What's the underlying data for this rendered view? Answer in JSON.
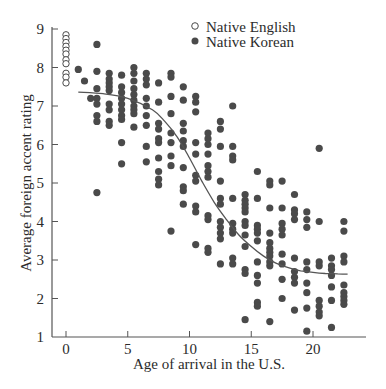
{
  "chart_data": {
    "type": "scatter",
    "title": "",
    "xlabel": "Age of arrival in the U.S.",
    "ylabel": "Average foreign accent rating",
    "xlim": [
      -1,
      24.3
    ],
    "ylim": [
      1,
      9
    ],
    "xticks": [
      0,
      5,
      10,
      15,
      20
    ],
    "yticks": [
      1,
      2,
      3,
      4,
      5,
      6,
      7,
      8,
      9
    ],
    "grid": false,
    "legend": {
      "position": "top-right",
      "entries": [
        {
          "label": "Native English",
          "marker": "open-circle"
        },
        {
          "label": "Native Korean",
          "marker": "filled-circle"
        }
      ]
    },
    "colors": {
      "points": "#4a4a4a",
      "axis": "#555555",
      "curve": "#555555"
    },
    "series": [
      {
        "name": "Native English",
        "marker": "open-circle",
        "points": [
          [
            0,
            8.85
          ],
          [
            0,
            8.75
          ],
          [
            0,
            8.65
          ],
          [
            0,
            8.55
          ],
          [
            0,
            8.45
          ],
          [
            0,
            8.35
          ],
          [
            0,
            8.2
          ],
          [
            0,
            8.1
          ],
          [
            0,
            7.85
          ],
          [
            0,
            7.75
          ],
          [
            0,
            7.6
          ]
        ]
      },
      {
        "name": "Native Korean",
        "marker": "filled-circle",
        "points": [
          [
            1,
            7.95
          ],
          [
            1.5,
            7.65
          ],
          [
            2,
            7.2
          ],
          [
            2.5,
            8.6
          ],
          [
            2.5,
            7.9
          ],
          [
            2.5,
            7.45
          ],
          [
            2.5,
            7.2
          ],
          [
            2.5,
            7.05
          ],
          [
            2.5,
            6.75
          ],
          [
            2.5,
            6.6
          ],
          [
            2.5,
            4.75
          ],
          [
            3.5,
            7.85
          ],
          [
            3.5,
            7.7
          ],
          [
            3.5,
            7.6
          ],
          [
            3.5,
            7.5
          ],
          [
            3.5,
            7.4
          ],
          [
            3.5,
            7.05
          ],
          [
            3.5,
            6.9
          ],
          [
            3.5,
            6.6
          ],
          [
            3.5,
            6.5
          ],
          [
            4.5,
            7.8
          ],
          [
            4.5,
            7.5
          ],
          [
            4.5,
            7.35
          ],
          [
            4.5,
            7.2
          ],
          [
            4.5,
            7.05
          ],
          [
            4.5,
            6.9
          ],
          [
            4.5,
            6.75
          ],
          [
            4.5,
            6.65
          ],
          [
            4.5,
            6.05
          ],
          [
            4.5,
            5.5
          ],
          [
            5.5,
            8.0
          ],
          [
            5.5,
            7.85
          ],
          [
            5.5,
            7.65
          ],
          [
            5.5,
            7.45
          ],
          [
            5.5,
            7.3
          ],
          [
            5.5,
            7.15
          ],
          [
            5.5,
            7.0
          ],
          [
            5.5,
            6.9
          ],
          [
            5.5,
            6.8
          ],
          [
            5.5,
            6.45
          ],
          [
            6.5,
            7.85
          ],
          [
            6.5,
            7.7
          ],
          [
            6.5,
            7.55
          ],
          [
            6.5,
            7.2
          ],
          [
            6.5,
            7.0
          ],
          [
            6.5,
            6.75
          ],
          [
            6.5,
            6.5
          ],
          [
            6.5,
            5.95
          ],
          [
            6.5,
            5.55
          ],
          [
            7.5,
            7.6
          ],
          [
            7.5,
            7.1
          ],
          [
            7.5,
            6.55
          ],
          [
            7.5,
            6.4
          ],
          [
            7.5,
            6.15
          ],
          [
            7.5,
            6.05
          ],
          [
            7.5,
            5.65
          ],
          [
            7.5,
            5.3
          ],
          [
            7.5,
            5.1
          ],
          [
            7.5,
            4.95
          ],
          [
            8.5,
            7.85
          ],
          [
            8.5,
            7.75
          ],
          [
            8.5,
            7.25
          ],
          [
            8.5,
            6.8
          ],
          [
            8.5,
            6.3
          ],
          [
            8.5,
            6.05
          ],
          [
            8.5,
            5.7
          ],
          [
            8.5,
            5.45
          ],
          [
            8.5,
            3.75
          ],
          [
            9.5,
            7.5
          ],
          [
            9.5,
            7.15
          ],
          [
            9.5,
            6.55
          ],
          [
            9.5,
            6.35
          ],
          [
            9.5,
            6.1
          ],
          [
            9.5,
            5.95
          ],
          [
            9.5,
            5.4
          ],
          [
            9.5,
            4.9
          ],
          [
            9.5,
            4.8
          ],
          [
            9.5,
            4.45
          ],
          [
            10.5,
            7.25
          ],
          [
            10.5,
            7.1
          ],
          [
            10.5,
            6.85
          ],
          [
            10.5,
            6.05
          ],
          [
            10.5,
            5.75
          ],
          [
            10.5,
            5.2
          ],
          [
            10.5,
            5.05
          ],
          [
            10.5,
            4.4
          ],
          [
            10.5,
            4.25
          ],
          [
            10.5,
            3.4
          ],
          [
            11.5,
            6.3
          ],
          [
            11.5,
            6.15
          ],
          [
            11.5,
            6.0
          ],
          [
            11.5,
            5.75
          ],
          [
            11.5,
            5.45
          ],
          [
            11.5,
            5.3
          ],
          [
            11.5,
            5.15
          ],
          [
            11.5,
            4.15
          ],
          [
            11.5,
            4.05
          ],
          [
            11.5,
            3.3
          ],
          [
            11.5,
            3.2
          ],
          [
            12.5,
            6.6
          ],
          [
            12.5,
            6.4
          ],
          [
            12.5,
            5.95
          ],
          [
            12.5,
            5.05
          ],
          [
            12.5,
            4.6
          ],
          [
            12.5,
            4.45
          ],
          [
            12.5,
            4.0
          ],
          [
            12.5,
            3.85
          ],
          [
            12.5,
            3.7
          ],
          [
            12.5,
            3.55
          ],
          [
            12.5,
            2.9
          ],
          [
            13.5,
            7.0
          ],
          [
            13.5,
            5.95
          ],
          [
            13.5,
            5.7
          ],
          [
            13.5,
            5.6
          ],
          [
            13.5,
            4.6
          ],
          [
            13.5,
            3.95
          ],
          [
            13.5,
            3.8
          ],
          [
            13.5,
            3.7
          ],
          [
            13.5,
            3.05
          ],
          [
            13.5,
            2.9
          ],
          [
            14.5,
            4.7
          ],
          [
            14.5,
            4.55
          ],
          [
            14.5,
            4.45
          ],
          [
            14.5,
            4.35
          ],
          [
            14.5,
            4.25
          ],
          [
            14.5,
            4.0
          ],
          [
            14.5,
            3.9
          ],
          [
            14.5,
            3.65
          ],
          [
            14.5,
            3.35
          ],
          [
            14.5,
            2.75
          ],
          [
            14.5,
            2.65
          ],
          [
            14.5,
            1.45
          ],
          [
            15.5,
            5.3
          ],
          [
            15.5,
            4.6
          ],
          [
            15.5,
            3.9
          ],
          [
            15.5,
            3.8
          ],
          [
            15.5,
            3.7
          ],
          [
            15.5,
            3.5
          ],
          [
            15.5,
            2.95
          ],
          [
            15.5,
            2.6
          ],
          [
            15.5,
            2.4
          ],
          [
            15.5,
            1.9
          ],
          [
            15.5,
            1.8
          ],
          [
            16.5,
            5.05
          ],
          [
            16.5,
            4.95
          ],
          [
            16.5,
            4.35
          ],
          [
            16.5,
            3.7
          ],
          [
            16.5,
            3.45
          ],
          [
            16.5,
            3.3
          ],
          [
            16.5,
            3.2
          ],
          [
            16.5,
            3.1
          ],
          [
            16.5,
            2.95
          ],
          [
            16.5,
            2.85
          ],
          [
            16.5,
            1.4
          ],
          [
            17.5,
            5.05
          ],
          [
            17.5,
            4.35
          ],
          [
            17.5,
            3.95
          ],
          [
            17.5,
            3.8
          ],
          [
            17.5,
            3.65
          ],
          [
            17.5,
            3.15
          ],
          [
            17.5,
            2.9
          ],
          [
            17.5,
            2.5
          ],
          [
            17.5,
            2.0
          ],
          [
            18.5,
            4.7
          ],
          [
            18.5,
            4.3
          ],
          [
            18.5,
            4.2
          ],
          [
            18.5,
            4.05
          ],
          [
            18.5,
            3.05
          ],
          [
            18.5,
            2.7
          ],
          [
            18.5,
            2.55
          ],
          [
            18.5,
            2.4
          ],
          [
            18.5,
            1.7
          ],
          [
            19.5,
            4.25
          ],
          [
            19.5,
            4.05
          ],
          [
            19.5,
            3.85
          ],
          [
            19.5,
            2.95
          ],
          [
            19.5,
            2.75
          ],
          [
            19.5,
            2.4
          ],
          [
            19.5,
            2.15
          ],
          [
            19.5,
            1.75
          ],
          [
            19.5,
            1.15
          ],
          [
            20.5,
            5.9
          ],
          [
            20.5,
            4.0
          ],
          [
            20.5,
            2.95
          ],
          [
            20.5,
            2.85
          ],
          [
            20.5,
            1.95
          ],
          [
            20.5,
            1.8
          ],
          [
            20.5,
            1.65
          ],
          [
            20.5,
            1.55
          ],
          [
            21.5,
            3.05
          ],
          [
            21.5,
            2.85
          ],
          [
            21.5,
            2.75
          ],
          [
            21.5,
            2.6
          ],
          [
            21.5,
            2.3
          ],
          [
            21.5,
            1.95
          ],
          [
            21.5,
            1.25
          ],
          [
            22.5,
            4.0
          ],
          [
            22.5,
            3.75
          ],
          [
            22.5,
            3.1
          ],
          [
            22.5,
            2.95
          ],
          [
            22.5,
            2.35
          ],
          [
            22.5,
            2.15
          ],
          [
            22.5,
            2.05
          ],
          [
            22.5,
            1.95
          ],
          [
            22.5,
            1.85
          ]
        ]
      }
    ],
    "fit_curve": {
      "type": "sigmoid",
      "points": [
        [
          1,
          7.36
        ],
        [
          3,
          7.32
        ],
        [
          5,
          7.2
        ],
        [
          7,
          6.9
        ],
        [
          8,
          6.6
        ],
        [
          9,
          6.2
        ],
        [
          10,
          5.65
        ],
        [
          11,
          5.05
        ],
        [
          12,
          4.5
        ],
        [
          13,
          4.05
        ],
        [
          14,
          3.65
        ],
        [
          15,
          3.35
        ],
        [
          16,
          3.1
        ],
        [
          17,
          2.92
        ],
        [
          18,
          2.8
        ],
        [
          19,
          2.72
        ],
        [
          20,
          2.68
        ],
        [
          21,
          2.65
        ],
        [
          22,
          2.64
        ],
        [
          22.8,
          2.63
        ]
      ]
    }
  }
}
